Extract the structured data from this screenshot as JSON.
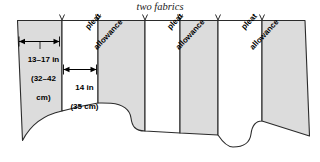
{
  "figure": {
    "title": "two fabrics",
    "colors": {
      "fabric_fill": "#dcdcdc",
      "pleat_fill": "#ffffff",
      "outline": "#2b2b2b",
      "page_background": "#ffffff",
      "text": "#000000"
    }
  },
  "measurements": [
    {
      "id": "panel-width",
      "line1": "13–17 in",
      "line2": "(32–42",
      "line3": "cm)",
      "full_text": "13–17 in (32–42 cm)",
      "inches": "13–17 in",
      "centimeters": "(32–42 cm)"
    },
    {
      "id": "pleat-width",
      "line1": "14 in",
      "line2": "(35 cm)",
      "full_text": "14 in (35 cm)",
      "inches": "14 in",
      "centimeters": "(35 cm)"
    }
  ],
  "pleat_labels": [
    {
      "line1": "pleat",
      "line2": "allowance"
    },
    {
      "line1": "pleat",
      "line2": "allowance"
    },
    {
      "line1": "pleat",
      "line2": "allowance"
    }
  ]
}
